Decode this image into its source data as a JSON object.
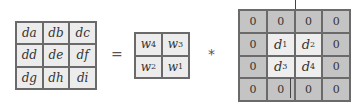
{
  "diagram": {
    "output_grid": [
      "da",
      "db",
      "dc",
      "dd",
      "de",
      "df",
      "dg",
      "dh",
      "di"
    ],
    "operators": {
      "equals": "=",
      "convolve": "*"
    },
    "kernel_grid": [
      {
        "base": "w",
        "sub": "4"
      },
      {
        "base": "w",
        "sub": "3"
      },
      {
        "base": "w",
        "sub": "2"
      },
      {
        "base": "w",
        "sub": "1"
      }
    ],
    "padded_input": [
      {
        "text": "0"
      },
      {
        "text": "0"
      },
      {
        "text": "0"
      },
      {
        "text": "0"
      },
      {
        "text": "0"
      },
      {
        "base": "d",
        "sub": "1"
      },
      {
        "base": "d",
        "sub": "2"
      },
      {
        "text": "0"
      },
      {
        "text": "0"
      },
      {
        "base": "d",
        "sub": "3"
      },
      {
        "base": "d",
        "sub": "4"
      },
      {
        "text": "0"
      },
      {
        "text": "0"
      },
      {
        "text": "0"
      },
      {
        "text": "0"
      },
      {
        "text": "0"
      }
    ]
  }
}
